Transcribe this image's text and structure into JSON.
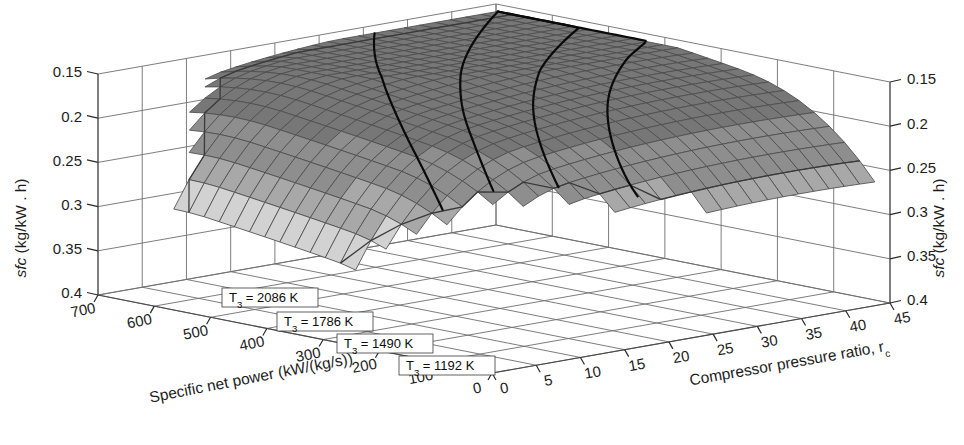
{
  "figure": {
    "kind": "3d-surface-plot",
    "background_color": "#ffffff",
    "mesh_color": "#4d4d4d",
    "contour_color": "#0a0a0a",
    "frame_color": "#6e6e6e"
  },
  "axes": {
    "z_left": {
      "title_prefix": "sfc",
      "title_suffix": " (kg/kW . h)",
      "title_full": "sfc (kg/kW . h)",
      "ticks": [
        "0.15",
        "0.2",
        "0.25",
        "0.3",
        "0.35",
        "0.4"
      ],
      "range": [
        0.15,
        0.4
      ],
      "direction": "inverted"
    },
    "z_right": {
      "title_prefix": "sfc",
      "title_suffix": " (kg/kW . h)",
      "title_full": "sfc (kg/kW . h)",
      "ticks": [
        "0.15",
        "0.2",
        "0.25",
        "0.3",
        "0.35",
        "0.4"
      ],
      "range": [
        0.15,
        0.4
      ],
      "direction": "inverted"
    },
    "x_left": {
      "title": "Specific net power (kW/(kg/s))",
      "ticks": [
        "700",
        "600",
        "500",
        "400",
        "300",
        "200",
        "100",
        "0"
      ],
      "range": [
        0,
        700
      ]
    },
    "x_right": {
      "title_prefix": "Compressor pressure ratio, r",
      "title_subscript": "c",
      "title_full": "Compressor pressure ratio, rc",
      "ticks": [
        "0",
        "5",
        "10",
        "15",
        "20",
        "25",
        "30",
        "35",
        "40",
        "45"
      ],
      "range": [
        0,
        45
      ]
    }
  },
  "contour_labels": [
    {
      "id": "t3-2086",
      "prefix": "T",
      "subscript": "3",
      "equals": " = ",
      "value": "2086",
      "unit": " K",
      "text": "T3 = 2086 K"
    },
    {
      "id": "t3-1786",
      "prefix": "T",
      "subscript": "3",
      "equals": " = ",
      "value": "1786",
      "unit": " K",
      "text": "T3 = 1786 K"
    },
    {
      "id": "t3-1490",
      "prefix": "T",
      "subscript": "3",
      "equals": " = ",
      "value": "1490",
      "unit": " K",
      "text": "T3 = 1490 K"
    },
    {
      "id": "t3-1192",
      "prefix": "T",
      "subscript": "3",
      "equals": " = ",
      "value": "1192",
      "unit": " K",
      "text": "T3 = 1192 K"
    }
  ],
  "chart_data": {
    "type": "surface",
    "title": "",
    "xlabel": "Specific net power (kW/(kg/s))",
    "ylabel": "Compressor pressure ratio, rc",
    "zlabel": "sfc (kg/kW . h)",
    "xlim": [
      0,
      700
    ],
    "ylim": [
      0,
      45
    ],
    "zlim": [
      0.15,
      0.4
    ],
    "z_inverted": true,
    "grid": true,
    "legend": "none",
    "colormap": "grayscale-banded",
    "xticks": [
      0,
      100,
      200,
      300,
      400,
      500,
      600,
      700
    ],
    "yticks": [
      0,
      5,
      10,
      15,
      20,
      25,
      30,
      35,
      40,
      45
    ],
    "zticks": [
      0.15,
      0.2,
      0.25,
      0.3,
      0.35,
      0.4
    ],
    "annotations": [
      {
        "text": "T3 = 2086 K",
        "describes": "constant turbine inlet temperature contour, highest"
      },
      {
        "text": "T3 = 1786 K",
        "describes": "constant turbine inlet temperature contour"
      },
      {
        "text": "T3 = 1490 K",
        "describes": "constant turbine inlet temperature contour"
      },
      {
        "text": "T3 = 1192 K",
        "describes": "constant turbine inlet temperature contour, lowest"
      }
    ],
    "contour_series": [
      {
        "name": "T3 = 2086 K",
        "temperature_K": 2086
      },
      {
        "name": "T3 = 1786 K",
        "temperature_K": 1786
      },
      {
        "name": "T3 = 1490 K",
        "temperature_K": 1490
      },
      {
        "name": "T3 = 1192 K",
        "temperature_K": 1192
      }
    ],
    "surface_bands": [
      {
        "sfc_range": [
          0.15,
          0.2
        ],
        "gray": "#777777"
      },
      {
        "sfc_range": [
          0.2,
          0.24
        ],
        "gray": "#8e8e8e"
      },
      {
        "sfc_range": [
          0.24,
          0.27
        ],
        "gray": "#a8a8a8"
      },
      {
        "sfc_range": [
          0.27,
          0.31
        ],
        "gray": "#d2d2d2"
      },
      {
        "sfc_range": [
          0.31,
          0.35
        ],
        "gray": "#b4b4b4"
      },
      {
        "sfc_range": [
          0.35,
          0.4
        ],
        "gray": "#7b7b7b"
      }
    ]
  }
}
